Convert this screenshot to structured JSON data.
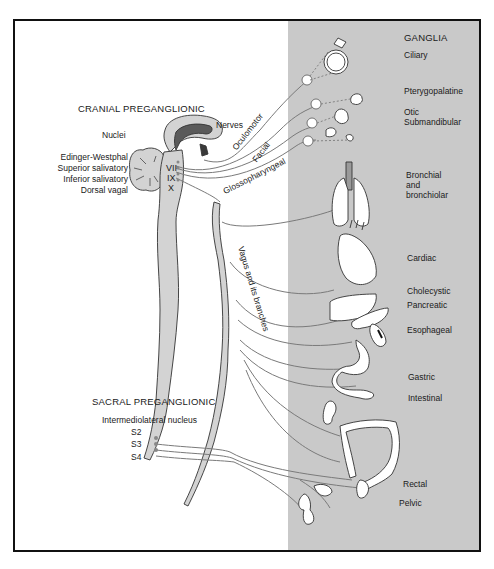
{
  "diagram": {
    "type": "anatomical-pathway",
    "colors": {
      "border": "#111111",
      "ganglia_panel": "#c9c9c9",
      "nerve_line": "#7a7a7a",
      "tissue_fill": "#d3d3d3",
      "dark_tissue": "#5a5a5a"
    },
    "cranial": {
      "heading": "CRANIAL PREGANGLIONIC",
      "nuclei_label": "Nuclei",
      "nerves_label": "Nerves",
      "nuclei": [
        "Edinger-Westphal",
        "Superior salivatory",
        "Inferior salivatory",
        "Dorsal vagal"
      ],
      "cranial_nerve_numerals": [
        "III",
        "VII",
        "IX",
        "X"
      ],
      "nerves": [
        "Oculomotor",
        "Facial",
        "Glossopharyngeal",
        "Vagus and its branches"
      ]
    },
    "sacral": {
      "heading": "SACRAL PREGANGLIONIC",
      "nucleus_label": "Intermediolateral nucleus",
      "segments": [
        "S2",
        "S3",
        "S4"
      ]
    },
    "ganglia": {
      "heading": "GANGLIA",
      "items": [
        {
          "label": "Ciliary",
          "organ": "eye"
        },
        {
          "label": "Pterygopalatine",
          "organ": "lacrimal-gland"
        },
        {
          "label": "Otic",
          "organ": "parotid-gland"
        },
        {
          "label": "Submandibular",
          "organ": "salivary-glands"
        },
        {
          "label": "Bronchial",
          "organ": "lungs"
        },
        {
          "label": "and",
          "organ": "lungs"
        },
        {
          "label": "bronchiolar",
          "organ": "lungs"
        },
        {
          "label": "Cardiac",
          "organ": "heart"
        },
        {
          "label": "Cholecystic",
          "organ": "liver-gallbladder"
        },
        {
          "label": "Pancreatic",
          "organ": "pancreas"
        },
        {
          "label": "Esophageal",
          "organ": "esophagus"
        },
        {
          "label": "Gastric",
          "organ": "stomach"
        },
        {
          "label": "Intestinal",
          "organ": "small-intestine"
        },
        {
          "label": "Rectal",
          "organ": "colon-rectum"
        },
        {
          "label": "Pelvic",
          "organ": "bladder-genitals"
        }
      ]
    }
  }
}
